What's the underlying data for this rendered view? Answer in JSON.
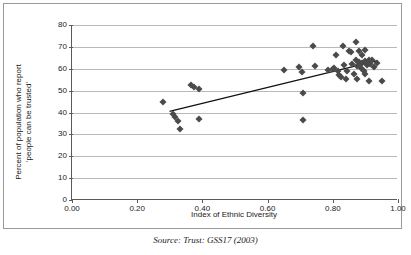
{
  "chart_data": {
    "type": "scatter",
    "title": "",
    "xlabel": "Index of Ethnic Diversity",
    "ylabel_line1": "Percent of population who report",
    "ylabel_line2": "'people can be trusted'",
    "xlim": [
      0.0,
      1.0
    ],
    "ylim": [
      0,
      80
    ],
    "xticks": [
      "0.00",
      "0.20",
      "0.40",
      "0.60",
      "0.80",
      "1.00"
    ],
    "xtick_values": [
      0.0,
      0.2,
      0.4,
      0.6,
      0.8,
      1.0
    ],
    "yticks": [
      "0",
      "10",
      "20",
      "30",
      "40",
      "50",
      "60",
      "70",
      "80"
    ],
    "ytick_values": [
      0,
      10,
      20,
      30,
      40,
      50,
      60,
      70,
      80
    ],
    "grid": "horizontal",
    "legend": "none",
    "marker": "diamond",
    "marker_color": "#4a4a4a",
    "trendline": {
      "visible": true,
      "color": "#111111",
      "x_start": 0.3,
      "y_start": 40.3,
      "x_end": 0.94,
      "y_end": 63.6
    },
    "points": [
      {
        "x": 0.28,
        "y": 44.8
      },
      {
        "x": 0.31,
        "y": 39.2
      },
      {
        "x": 0.315,
        "y": 37.8
      },
      {
        "x": 0.325,
        "y": 36.2
      },
      {
        "x": 0.33,
        "y": 32.3
      },
      {
        "x": 0.365,
        "y": 52.8
      },
      {
        "x": 0.375,
        "y": 51.8
      },
      {
        "x": 0.39,
        "y": 50.9
      },
      {
        "x": 0.39,
        "y": 37.1
      },
      {
        "x": 0.65,
        "y": 59.5
      },
      {
        "x": 0.695,
        "y": 61.0
      },
      {
        "x": 0.705,
        "y": 58.6
      },
      {
        "x": 0.71,
        "y": 48.9
      },
      {
        "x": 0.71,
        "y": 36.6
      },
      {
        "x": 0.74,
        "y": 70.2
      },
      {
        "x": 0.745,
        "y": 61.1
      },
      {
        "x": 0.785,
        "y": 59.5
      },
      {
        "x": 0.8,
        "y": 60.0
      },
      {
        "x": 0.805,
        "y": 60.3
      },
      {
        "x": 0.81,
        "y": 66.4
      },
      {
        "x": 0.815,
        "y": 58.8
      },
      {
        "x": 0.82,
        "y": 57.0
      },
      {
        "x": 0.825,
        "y": 56.2
      },
      {
        "x": 0.83,
        "y": 70.3
      },
      {
        "x": 0.835,
        "y": 61.5
      },
      {
        "x": 0.84,
        "y": 55.4
      },
      {
        "x": 0.845,
        "y": 59.2
      },
      {
        "x": 0.85,
        "y": 68.1
      },
      {
        "x": 0.855,
        "y": 67.5
      },
      {
        "x": 0.86,
        "y": 62.0
      },
      {
        "x": 0.865,
        "y": 57.8
      },
      {
        "x": 0.87,
        "y": 72.4
      },
      {
        "x": 0.87,
        "y": 64.0
      },
      {
        "x": 0.875,
        "y": 61.2
      },
      {
        "x": 0.875,
        "y": 55.2
      },
      {
        "x": 0.88,
        "y": 68.0
      },
      {
        "x": 0.88,
        "y": 63.0
      },
      {
        "x": 0.885,
        "y": 60.5
      },
      {
        "x": 0.89,
        "y": 66.2
      },
      {
        "x": 0.89,
        "y": 62.6
      },
      {
        "x": 0.895,
        "y": 59.0
      },
      {
        "x": 0.9,
        "y": 68.6
      },
      {
        "x": 0.9,
        "y": 63.4
      },
      {
        "x": 0.9,
        "y": 57.8
      },
      {
        "x": 0.905,
        "y": 61.8
      },
      {
        "x": 0.91,
        "y": 64.2
      },
      {
        "x": 0.91,
        "y": 54.2
      },
      {
        "x": 0.915,
        "y": 62.2
      },
      {
        "x": 0.92,
        "y": 63.8
      },
      {
        "x": 0.925,
        "y": 60.8
      },
      {
        "x": 0.935,
        "y": 62.8
      },
      {
        "x": 0.95,
        "y": 54.6
      }
    ]
  },
  "caption": {
    "source": "Source: Trust: GSS17 (2003)"
  }
}
